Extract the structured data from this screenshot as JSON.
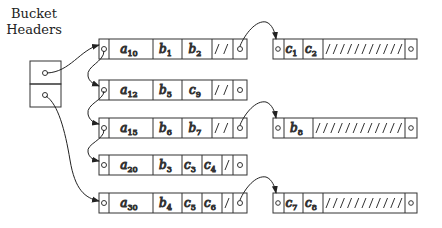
{
  "title": "Bucket Headers",
  "title_lines": [
    "Bucket",
    "Headers"
  ],
  "colors": {
    "stroke": "#333333",
    "text": "#222222",
    "background": "#ffffff"
  },
  "bucket_headers": {
    "slots": 2
  },
  "blocks": [
    {
      "id": "blk1",
      "cells": [
        {
          "base": "a",
          "sub": "10"
        },
        {
          "base": "b",
          "sub": "1"
        },
        {
          "base": "b",
          "sub": "2"
        }
      ],
      "hatch": "//",
      "overflow": "blk1o"
    },
    {
      "id": "blk2",
      "cells": [
        {
          "base": "a",
          "sub": "12"
        },
        {
          "base": "b",
          "sub": "5"
        },
        {
          "base": "c",
          "sub": "9"
        }
      ],
      "hatch": "////",
      "overflow": null
    },
    {
      "id": "blk3",
      "cells": [
        {
          "base": "a",
          "sub": "15"
        },
        {
          "base": "b",
          "sub": "6"
        },
        {
          "base": "b",
          "sub": "7"
        }
      ],
      "hatch": "//",
      "overflow": "blk3o"
    },
    {
      "id": "blk4",
      "cells": [
        {
          "base": "a",
          "sub": "20"
        },
        {
          "base": "b",
          "sub": "3"
        },
        {
          "base": "c",
          "sub": "3"
        },
        {
          "base": "c",
          "sub": "4"
        }
      ],
      "hatch": "/",
      "overflow": null
    },
    {
      "id": "blk5",
      "cells": [
        {
          "base": "a",
          "sub": "30"
        },
        {
          "base": "b",
          "sub": "4"
        },
        {
          "base": "c",
          "sub": "5"
        },
        {
          "base": "c",
          "sub": "6"
        }
      ],
      "hatch": "/",
      "overflow": "blk5o"
    }
  ],
  "overflow_blocks": [
    {
      "id": "blk1o",
      "cells": [
        {
          "base": "c",
          "sub": "1"
        },
        {
          "base": "c",
          "sub": "2"
        }
      ],
      "hatch": "///////////"
    },
    {
      "id": "blk3o",
      "cells": [
        {
          "base": "b",
          "sub": "8"
        }
      ],
      "hatch": "/////////////"
    },
    {
      "id": "blk5o",
      "cells": [
        {
          "base": "c",
          "sub": "7"
        },
        {
          "base": "c",
          "sub": "8"
        }
      ],
      "hatch": "///////////"
    }
  ],
  "chains": [
    {
      "from": "header-slot-1",
      "to": "blk1"
    },
    {
      "from": "blk1",
      "to": "blk2"
    },
    {
      "from": "header-slot-2",
      "to": "blk5"
    },
    {
      "from": "blk3",
      "to": "blk4"
    },
    {
      "from": "blk2",
      "to": "blk3"
    }
  ]
}
